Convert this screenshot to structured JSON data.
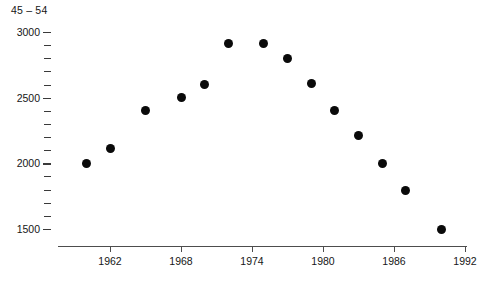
{
  "chart_data": {
    "type": "scatter",
    "title": "45 – 54",
    "xlabel": "",
    "ylabel": "",
    "xlim": [
      1959,
      1992.5
    ],
    "ylim": [
      1430,
      3050
    ],
    "grid": false,
    "legend": false,
    "marker": "filled-circle",
    "marker_color": "#0a0a0a",
    "x": [
      1960,
      1962,
      1965,
      1968,
      1970,
      1972,
      1975,
      1977,
      1979,
      1981,
      1983,
      1985,
      1987,
      1990
    ],
    "values": [
      2000,
      2110,
      2400,
      2500,
      2600,
      2910,
      2910,
      2800,
      2610,
      2400,
      2210,
      2000,
      1790,
      1500
    ],
    "points": [
      {
        "x": 1960,
        "y": 2000
      },
      {
        "x": 1962,
        "y": 2110
      },
      {
        "x": 1965,
        "y": 2400
      },
      {
        "x": 1968,
        "y": 2500
      },
      {
        "x": 1970,
        "y": 2600
      },
      {
        "x": 1972,
        "y": 2910
      },
      {
        "x": 1975,
        "y": 2910
      },
      {
        "x": 1977,
        "y": 2800
      },
      {
        "x": 1979,
        "y": 2610
      },
      {
        "x": 1981,
        "y": 2400
      },
      {
        "x": 1983,
        "y": 2210
      },
      {
        "x": 1985,
        "y": 2000
      },
      {
        "x": 1987,
        "y": 1790
      },
      {
        "x": 1990,
        "y": 1500
      }
    ],
    "x_ticks": [
      1962,
      1968,
      1974,
      1980,
      1986,
      1992
    ],
    "x_tick_labels": [
      "1962",
      "1968",
      "1974",
      "1980",
      "1986",
      "1992"
    ],
    "y_ticks_major": [
      1500,
      2000,
      2500,
      3000
    ],
    "y_tick_labels": [
      "1500",
      "2000",
      "2500",
      "3000"
    ],
    "y_ticks_minor": [
      1600,
      1700,
      1800,
      1900,
      2100,
      2200,
      2300,
      2400,
      2600,
      2700,
      2800,
      2900
    ],
    "y_tick_step_minor": 100,
    "axis_color": "#4d4d4d",
    "background": "#ffffff"
  }
}
